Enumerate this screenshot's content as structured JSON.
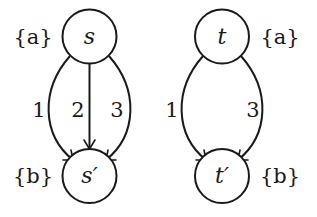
{
  "diagram": {
    "graphs": [
      {
        "name": "left-graph",
        "nodes": [
          {
            "id": "s",
            "label": "s",
            "set_label": "{a}"
          },
          {
            "id": "s_prime",
            "label": "s′",
            "set_label": "{b}"
          }
        ],
        "edges": [
          {
            "from": "s",
            "to": "s_prime",
            "label": "1"
          },
          {
            "from": "s",
            "to": "s_prime",
            "label": "2"
          },
          {
            "from": "s",
            "to": "s_prime",
            "label": "3"
          }
        ]
      },
      {
        "name": "right-graph",
        "nodes": [
          {
            "id": "t",
            "label": "t",
            "set_label": "{a}"
          },
          {
            "id": "t_prime",
            "label": "t′",
            "set_label": "{b}"
          }
        ],
        "edges": [
          {
            "from": "t",
            "to": "t_prime",
            "label": "1"
          },
          {
            "from": "t",
            "to": "t_prime",
            "label": "3"
          }
        ]
      }
    ],
    "colors": {
      "stroke": "#1a1a1a",
      "background": "#ffffff"
    }
  }
}
